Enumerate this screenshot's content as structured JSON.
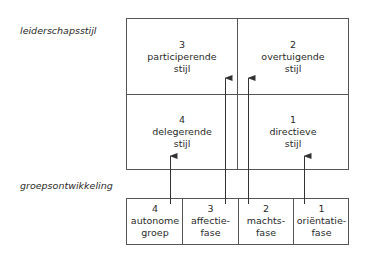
{
  "labels": {
    "leadership_axis": "leiderschapsstijl",
    "group_axis": "groepsontwikkeling"
  },
  "leadership_styles": [
    {
      "num": "3",
      "line1": "participerende",
      "line2": "stijl"
    },
    {
      "num": "2",
      "line1": "overtuigende",
      "line2": "stijl"
    },
    {
      "num": "4",
      "line1": "delegerende",
      "line2": "stijl"
    },
    {
      "num": "1",
      "line1": "directieve",
      "line2": "stijl"
    }
  ],
  "group_phases": [
    {
      "num": "4",
      "line1": "autonome",
      "line2": "groep"
    },
    {
      "num": "3",
      "line1": "affectie-",
      "line2": "fase"
    },
    {
      "num": "2",
      "line1": "machts-",
      "line2": "fase"
    },
    {
      "num": "1",
      "line1": "oriëntatie-",
      "line2": "fase"
    }
  ],
  "arrows": [
    {
      "from": "autonome groep",
      "to": "delegerende stijl"
    },
    {
      "from": "affectie-fase",
      "to": "participerende stijl"
    },
    {
      "from": "machts-fase",
      "to": "overtuigende stijl"
    },
    {
      "from": "oriëntatie-fase",
      "to": "directieve stijl"
    }
  ],
  "colors": {
    "line": "#555555",
    "text": "#2a2a2a"
  }
}
